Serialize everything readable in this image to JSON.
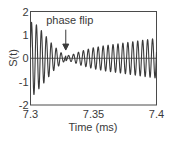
{
  "chart_data": {
    "type": "line",
    "title": "",
    "xlabel": "Time (ms)",
    "ylabel": "S(t)",
    "xlim": [
      7.3,
      7.4
    ],
    "ylim": [
      -2,
      2
    ],
    "x_ticks": [
      7.3,
      7.35,
      7.4
    ],
    "x_tick_labels": [
      "7.3",
      "7.35",
      "7.4"
    ],
    "y_ticks": [
      -2,
      -1,
      0,
      1,
      2
    ],
    "y_tick_labels": [
      "-2",
      "-1",
      "0",
      "1",
      "2"
    ],
    "grid": false,
    "zero_line": true,
    "series": [
      {
        "name": "S(t)",
        "model": "oscillation with decaying envelope before phase flip and growing envelope after",
        "frequency_cycles_per_ms": 255,
        "phase_flip_time_ms": 7.328,
        "envelope_points": {
          "t": [
            7.3,
            7.302,
            7.31,
            7.318,
            7.325,
            7.328,
            7.333,
            7.34,
            7.35,
            7.36,
            7.37,
            7.38,
            7.39,
            7.4
          ],
          "amplitude": [
            1.5,
            1.6,
            1.1,
            0.55,
            0.2,
            0.1,
            0.15,
            0.3,
            0.45,
            0.55,
            0.62,
            0.7,
            0.78,
            0.85
          ]
        },
        "color": "#3a3a3a"
      }
    ],
    "annotations": [
      {
        "text": "phase flip",
        "x": 7.328,
        "y": 1.35,
        "arrow_to": [
          7.328,
          0.35
        ]
      }
    ],
    "legend": "none"
  },
  "labels": {
    "annotation_text": "phase flip",
    "xlabel": "Time (ms)",
    "ylabel": "S(t)",
    "xticks": [
      "7.3",
      "7.35",
      "7.4"
    ],
    "yticks": [
      "2",
      "1",
      "0",
      "-1",
      "-2"
    ]
  }
}
